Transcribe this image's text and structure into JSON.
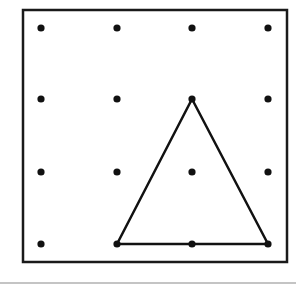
{
  "diagram": {
    "type": "geoboard",
    "grid": {
      "rows": 4,
      "cols": 4
    },
    "frame": {
      "x": 23,
      "y": 10,
      "width": 264,
      "height": 252,
      "stroke": "#1a1a1a"
    },
    "dots": {
      "xs": [
        41,
        117,
        192,
        268
      ],
      "ys": [
        28,
        99,
        172,
        244
      ],
      "color": "#111111"
    },
    "triangle": {
      "vertices": [
        [
          192,
          99
        ],
        [
          117,
          244
        ],
        [
          268,
          244
        ]
      ],
      "grid_vertices": [
        [
          2,
          1
        ],
        [
          1,
          3
        ],
        [
          3,
          3
        ]
      ],
      "stroke": "#111111"
    },
    "separator": {
      "y": 283,
      "color": "#b0b0b0"
    }
  }
}
